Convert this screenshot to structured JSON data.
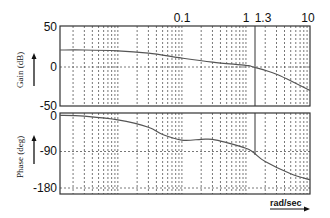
{
  "chart_data": [
    {
      "type": "line",
      "title": "Bode magnitude",
      "xlabel": "rad/sec",
      "ylabel": "Gain (dB)",
      "xscale": "log",
      "xlim": [
        0.00125,
        10
      ],
      "ylim": [
        -50,
        50
      ],
      "x_tick_labels": [
        "0.1",
        "1",
        "1.3",
        "10"
      ],
      "y_tick_labels": [
        "50",
        "0",
        "-50"
      ],
      "grid": true,
      "annotations": [
        {
          "type": "vline",
          "x": 1.3,
          "label": "1.3",
          "note": "gain crossover frequency"
        }
      ],
      "series": [
        {
          "name": "Gain",
          "x": [
            0.00125,
            0.003,
            0.01,
            0.03,
            0.1,
            0.3,
            1,
            1.3,
            3,
            10
          ],
          "values": [
            21,
            21,
            20,
            17,
            11,
            6,
            2,
            0,
            -9,
            -29
          ]
        }
      ]
    },
    {
      "type": "line",
      "title": "Bode phase",
      "xlabel": "rad/sec",
      "ylabel": "Phase (deg)",
      "xscale": "log",
      "xlim": [
        0.00125,
        10
      ],
      "ylim": [
        -190,
        5
      ],
      "y_tick_labels": [
        "0",
        "-90",
        "-180"
      ],
      "grid": true,
      "series": [
        {
          "name": "Phase",
          "x": [
            0.00125,
            0.003,
            0.01,
            0.03,
            0.05,
            0.1,
            0.2,
            0.3,
            0.5,
            1,
            1.3,
            2,
            5,
            10
          ],
          "values": [
            -1,
            -3,
            -12,
            -30,
            -48,
            -62,
            -60,
            -60,
            -68,
            -82,
            -92,
            -115,
            -145,
            -160
          ]
        }
      ]
    }
  ],
  "labels": {
    "x_top": [
      "0.1",
      "1",
      "1.3",
      "10"
    ],
    "gain_ticks": [
      "50",
      "0",
      "-50"
    ],
    "phase_ticks": [
      "0",
      "-90",
      "-180"
    ],
    "gain_axis": "Gain (dB)",
    "phase_axis": "Phase (deg)",
    "x_unit": "rad/sec"
  },
  "colors": {
    "line": "#555555",
    "frame": "#333333",
    "grid": "#555555"
  }
}
